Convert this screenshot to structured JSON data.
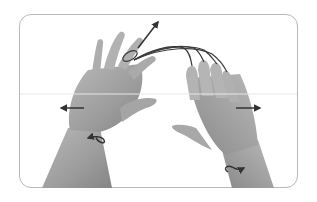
{
  "figure": {
    "alt": "Two hands performing a finger extension exercise with rubber bands; arrows indicate outward spreading and wrist rotation",
    "colors": {
      "frame": "#b8b8b8",
      "skin_light": "#b5b5b5",
      "skin_mid": "#9a9a9a",
      "skin_dark": "#7d7d7d",
      "band": "#3a3a3a",
      "arrow": "#333333",
      "background": "#ffffff"
    },
    "arrows": [
      {
        "name": "up-right-arrow",
        "direction": "up-right"
      },
      {
        "name": "left-arrow",
        "direction": "left"
      },
      {
        "name": "right-arrow",
        "direction": "right"
      },
      {
        "name": "rotate-left-wrist-arrow",
        "direction": "rotate"
      },
      {
        "name": "rotate-right-wrist-arrow",
        "direction": "rotate"
      }
    ]
  }
}
